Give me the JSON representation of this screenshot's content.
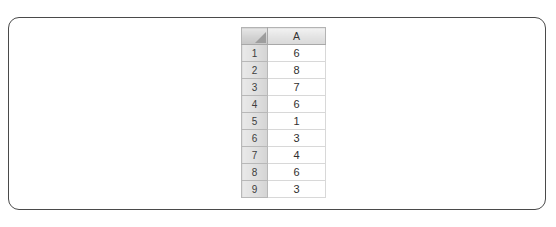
{
  "panel": {
    "name": "document-panel"
  },
  "spreadsheet": {
    "select_all_label": "",
    "corner_icon": "select-all-triangle-icon",
    "column_headers": [
      "A"
    ],
    "row_headers": [
      "1",
      "2",
      "3",
      "4",
      "5",
      "6",
      "7",
      "8",
      "9"
    ],
    "rows": [
      {
        "row": "1",
        "cells": [
          "6"
        ]
      },
      {
        "row": "2",
        "cells": [
          "8"
        ]
      },
      {
        "row": "3",
        "cells": [
          "7"
        ]
      },
      {
        "row": "4",
        "cells": [
          "6"
        ]
      },
      {
        "row": "5",
        "cells": [
          "1"
        ]
      },
      {
        "row": "6",
        "cells": [
          "3"
        ]
      },
      {
        "row": "7",
        "cells": [
          "4"
        ]
      },
      {
        "row": "8",
        "cells": [
          "6"
        ]
      },
      {
        "row": "9",
        "cells": [
          "3"
        ]
      }
    ]
  },
  "chart_data": {
    "type": "table",
    "title": "",
    "categories": [
      "1",
      "2",
      "3",
      "4",
      "5",
      "6",
      "7",
      "8",
      "9"
    ],
    "series": [
      {
        "name": "A",
        "values": [
          6,
          8,
          7,
          6,
          1,
          3,
          4,
          6,
          3
        ]
      }
    ],
    "xlabel": "",
    "ylabel": ""
  },
  "colors": {
    "panel_border": "#4a4a4a",
    "header_fill": "#e4e4e4",
    "row_header_fill": "#dedede",
    "grid_line": "#d8d8d8",
    "cell_text": "#303030",
    "background": "#ffffff"
  }
}
